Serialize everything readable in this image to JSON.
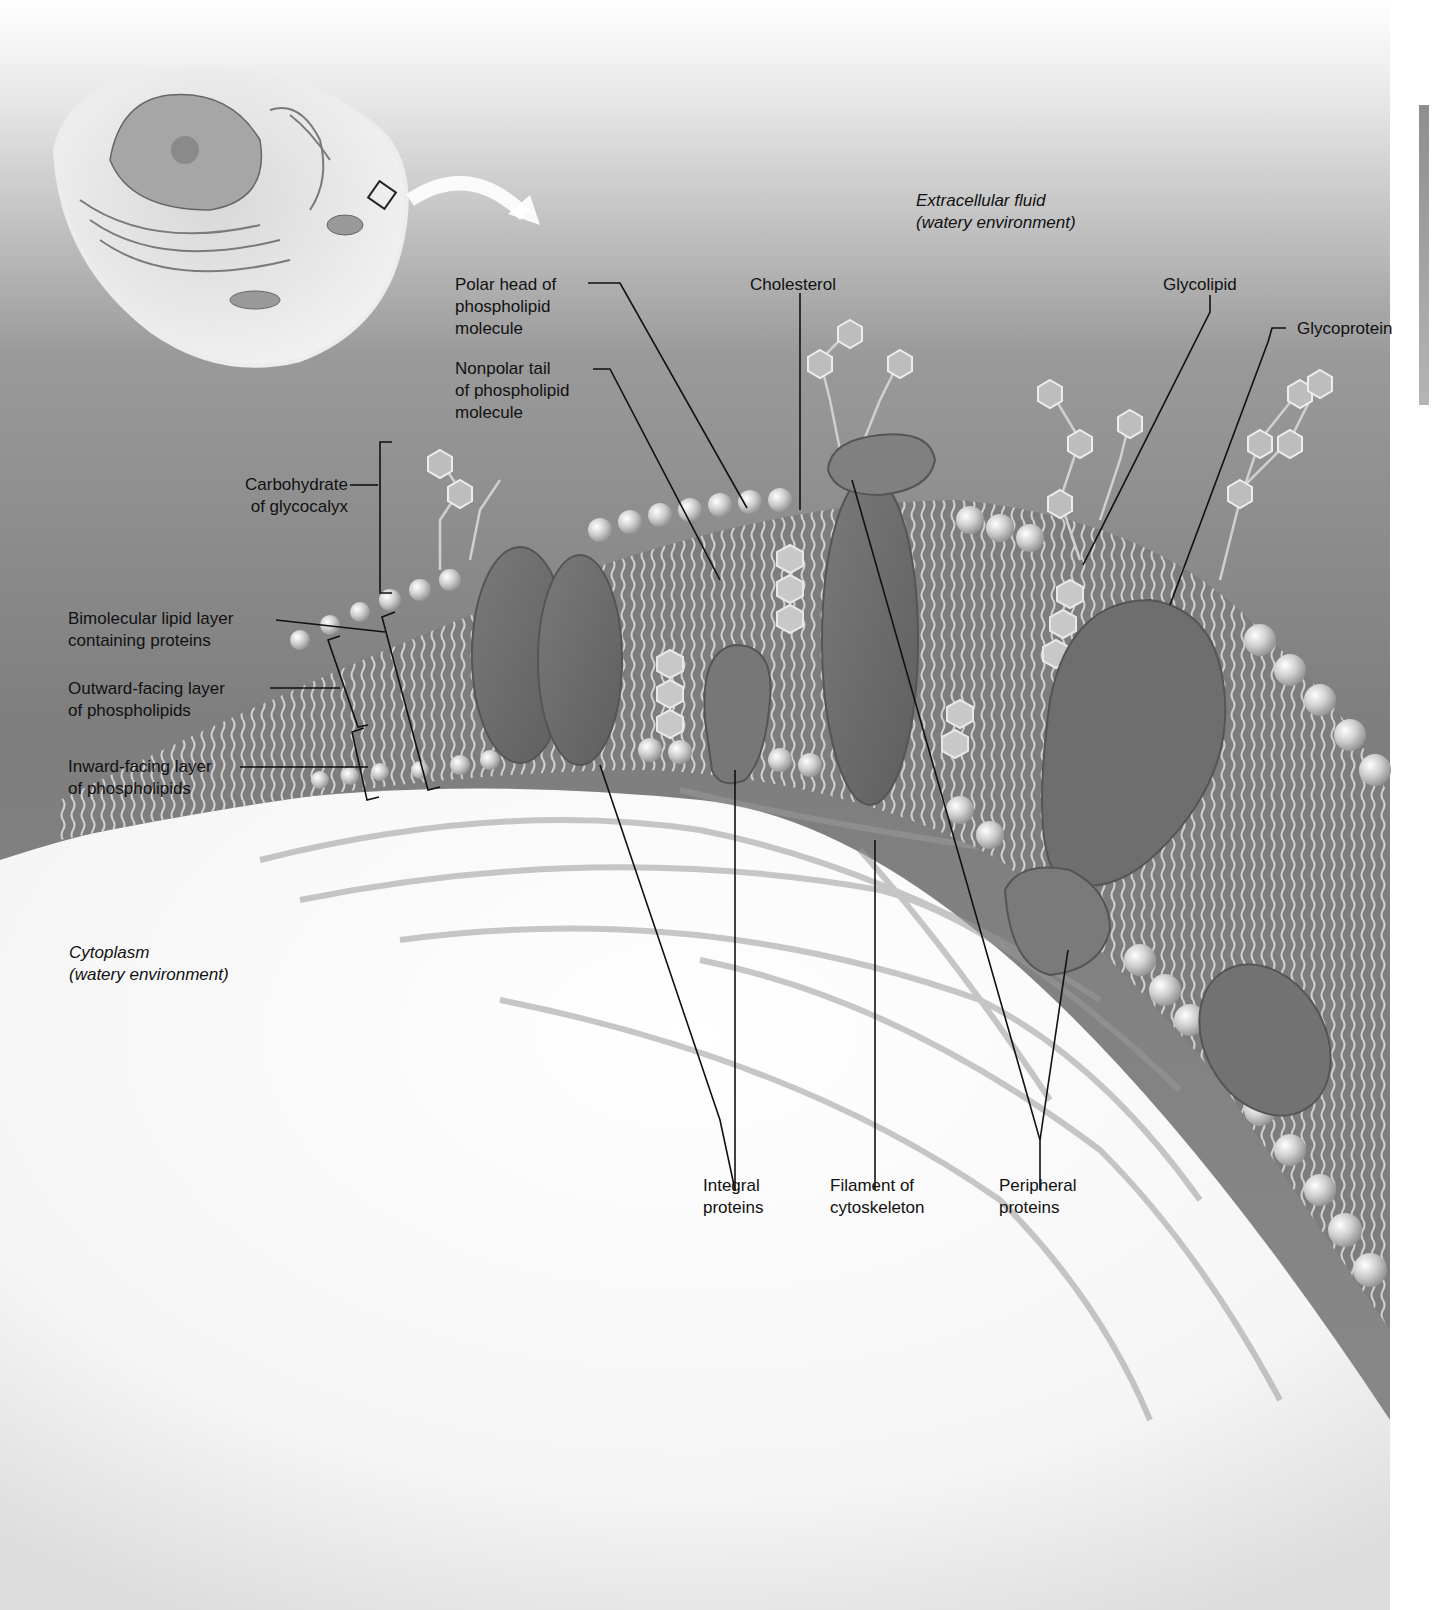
{
  "figure": {
    "background_colors": {
      "extracellular": "#8a8a8a",
      "cytoplasm": "#f4f4f4",
      "top_fade": "#ffffff"
    },
    "inset": {
      "name": "cell-overview-inset",
      "highlight": "square region on cell surface",
      "arrow": "curved arrow pointing to enlarged membrane view"
    }
  },
  "environments": {
    "extracellular": "Extracellular fluid\n(watery environment)",
    "cytoplasm": "Cytoplasm\n(watery environment)"
  },
  "labels": {
    "polar_head": "Polar head of\nphospholipid\nmolecule",
    "nonpolar_tail": "Nonpolar tail\nof phospholipid\nmolecule",
    "cholesterol": "Cholesterol",
    "glycolipid": "Glycolipid",
    "glycoprotein": "Glycoprotein",
    "carbohydrate": "Carbohydrate\nof glycocalyx",
    "bimolecular": "Bimolecular lipid layer\ncontaining proteins",
    "outward": "Outward-facing layer\nof phospholipids",
    "inward": "Inward-facing layer\nof phospholipids",
    "integral": "Integral\nproteins",
    "filament": "Filament of\ncytoskeleton",
    "peripheral": "Peripheral\nproteins"
  }
}
